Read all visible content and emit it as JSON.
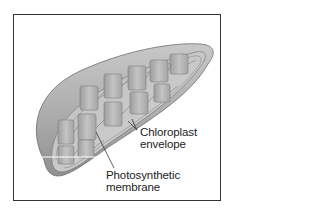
{
  "figure": {
    "colors": {
      "frame": "#333333",
      "envelope_outer": "#a8a8a8",
      "envelope_inner": "#c9c9c9",
      "grana": "#b5b5b5",
      "label_text": "#222222"
    }
  },
  "labels": {
    "envelope": {
      "line1": "Chloroplast",
      "line2": "envelope"
    },
    "membrane": {
      "line1": "Photosynthetic",
      "line2": "membrane"
    }
  }
}
